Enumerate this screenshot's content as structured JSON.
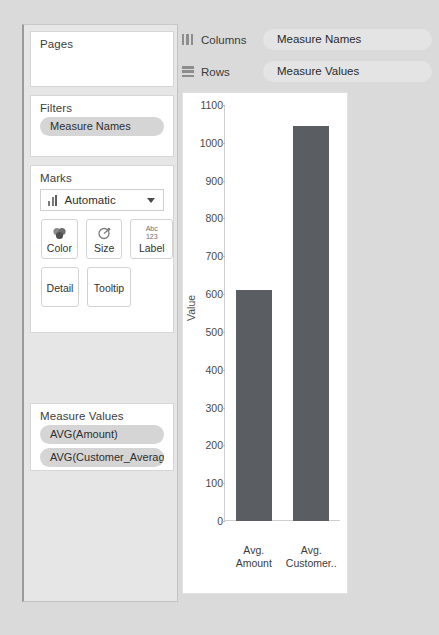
{
  "sidebar": {
    "pages": {
      "title": "Pages",
      "items": []
    },
    "filters": {
      "title": "Filters",
      "items": [
        "Measure Names"
      ]
    },
    "marks": {
      "title": "Marks",
      "mark_type": "Automatic",
      "mark_type_icon": "bar-chart-icon",
      "buttons": [
        {
          "label": "Color",
          "icon": "color-circles-icon"
        },
        {
          "label": "Size",
          "icon": "size-pie-icon"
        },
        {
          "label": "Label",
          "icon": "abc-123-icon",
          "glyph_top": "Abc",
          "glyph_bottom": "123"
        },
        {
          "label": "Detail",
          "icon": "detail-icon"
        },
        {
          "label": "Tooltip",
          "icon": "tooltip-icon"
        }
      ]
    },
    "measure_values": {
      "title": "Measure Values",
      "items": [
        "AVG(Amount)",
        "AVG(Customer_Averag.."
      ]
    }
  },
  "shelves": [
    {
      "name": "Columns",
      "icon": "columns-icon",
      "pill": "Measure Names"
    },
    {
      "name": "Rows",
      "icon": "rows-icon",
      "pill": "Measure Values"
    }
  ],
  "colors": {
    "bar": "#5a5d61",
    "pill": "#d5d5d5",
    "shelf_pill": "#e4e4e4",
    "page_background": "#dadada",
    "panel": "#e6e6e6"
  },
  "chart_data": {
    "type": "bar",
    "title": "",
    "xlabel": "",
    "ylabel": "Value",
    "categories": [
      "Avg. Amount",
      "Avg. Customer.."
    ],
    "category_lines": [
      [
        "Avg.",
        "Amount"
      ],
      [
        "Avg.",
        "Customer.."
      ]
    ],
    "values": [
      612,
      1045
    ],
    "ylim": [
      0,
      1100
    ],
    "yticks": [
      0,
      100,
      200,
      300,
      400,
      500,
      600,
      700,
      800,
      900,
      1000,
      1100
    ],
    "grid": false,
    "legend": false,
    "series": [
      {
        "name": "Measure Values",
        "values": [
          612,
          1045
        ]
      }
    ]
  }
}
